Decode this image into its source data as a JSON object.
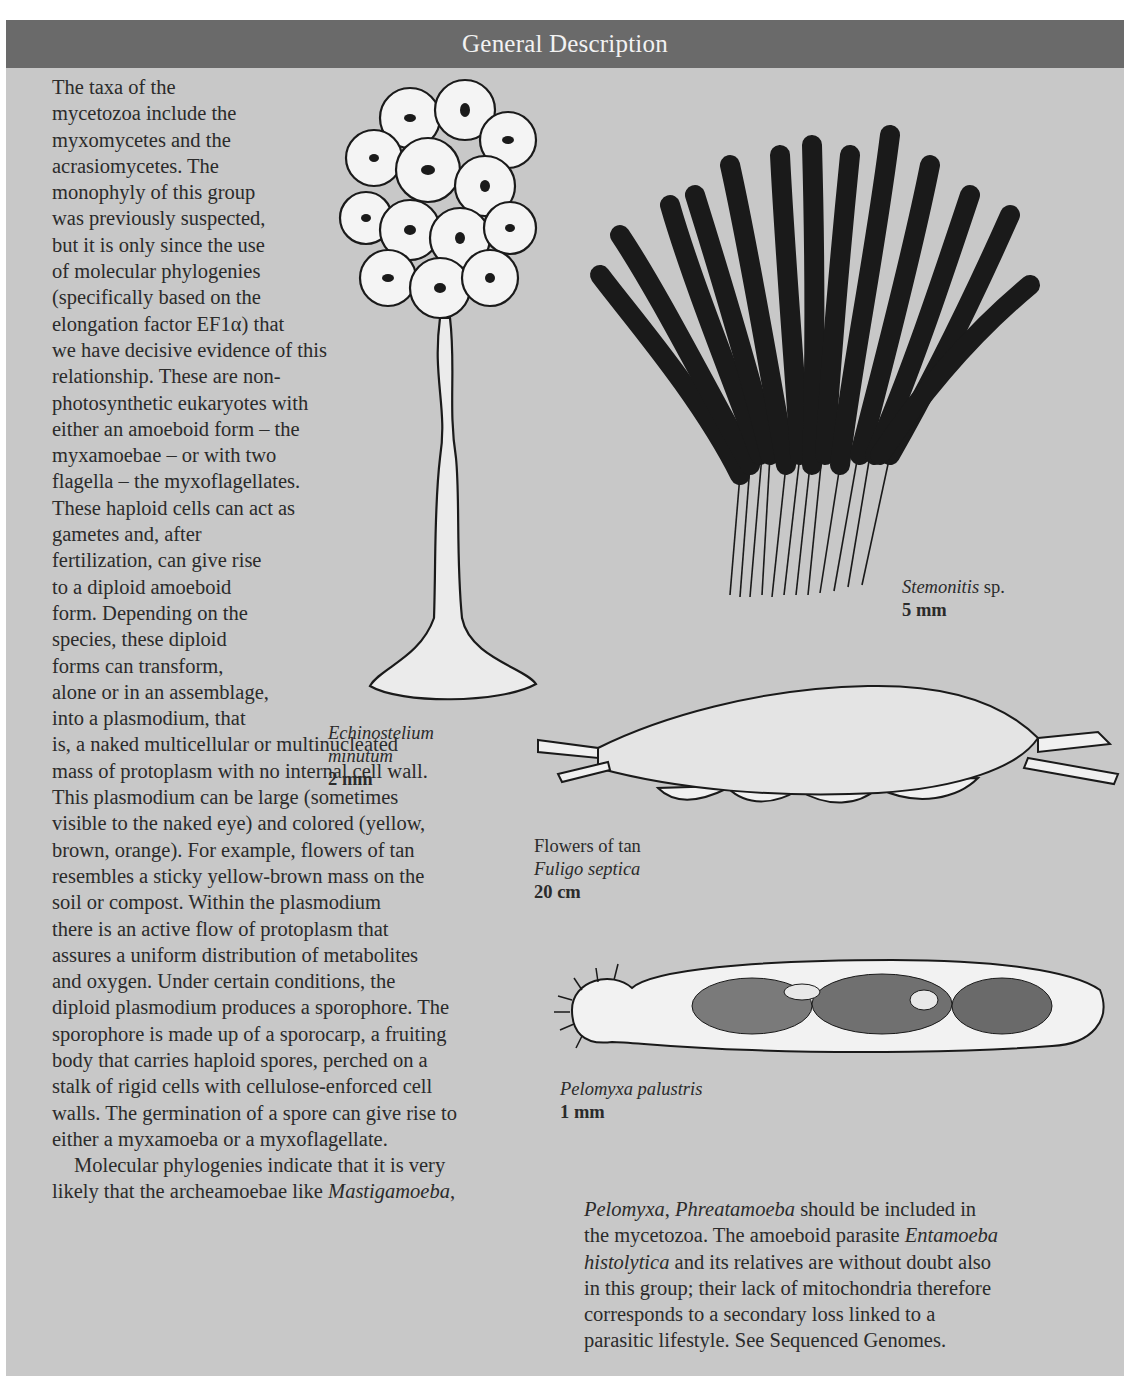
{
  "header": {
    "title": "General Description"
  },
  "colors": {
    "header_bg": "#6a6a6a",
    "panel_bg": "#c8c8c8",
    "text": "#2b2b2b",
    "header_text": "#f2f2f2"
  },
  "body_left": {
    "lines": [
      "The taxa of the",
      "mycetozoa include the",
      "myxomycetes and the",
      "acrasiomycetes. The",
      "monophyly of this group",
      "was previously suspected,",
      "but it is only since the use",
      "of molecular phylogenies",
      "(specifically based on the",
      "elongation factor EF1α) that",
      "we have decisive evidence of this",
      "relationship. These are non-",
      "photosynthetic eukaryotes with",
      "either an amoeboid form – the",
      "myxamoebae – or with two",
      "flagella – the myxoflagellates.",
      "These haploid cells can act as",
      "gametes and, after",
      "fertilization, can give rise",
      "to a diploid amoeboid",
      "form. Depending on the",
      "species, these diploid",
      "forms can transform,",
      "alone or in an assemblage,",
      "into a plasmodium, that",
      "is, a naked multicellular or multinucleated",
      "mass of protoplasm with no internal cell wall.",
      "This plasmodium can be large (sometimes",
      "visible to the naked eye) and colored (yellow,",
      "brown, orange). For example, flowers of tan",
      "resembles a sticky yellow-brown mass on the",
      "soil or compost. Within the plasmodium",
      "there is an active flow of protoplasm that",
      "assures a uniform distribution of metabolites",
      "and oxygen. Under certain conditions, the",
      "diploid plasmodium produces a sporophore. The",
      "sporophore is made up of a sporocarp, a fruiting",
      "body that carries haploid spores, perched on a",
      "stalk of rigid cells with cellulose-enforced cell",
      "walls. The germination of a spore can give rise to",
      "either a myxamoeba or a myxoflagellate."
    ],
    "para2_line1": "Molecular phylogenies indicate that it is very",
    "para2_line2_prefix": "likely that the archeamoebae like ",
    "para2_line2_italic": "Mastigamoeba",
    "para2_line2_suffix": ","
  },
  "body_right": {
    "l1_italic_a": "Pelomyxa",
    "l1_sep": ", ",
    "l1_italic_b": "Phreatamoeba",
    "l1_rest": " should be included in",
    "l2_prefix": "the mycetozoa. The amoeboid parasite ",
    "l2_italic": "Entamoeba",
    "l3_italic": "histolytica",
    "l3_rest": " and its relatives are without doubt also",
    "l4": "in this group; their lack of mitochondria therefore",
    "l5": "corresponds to a secondary loss linked to a",
    "l6": "parasitic lifestyle. See Sequenced Genomes."
  },
  "figures": [
    {
      "id": "echinostelium",
      "name_line1": "Echinostelium",
      "name_line2": "minutum",
      "size": "2 mm"
    },
    {
      "id": "stemonitis",
      "name_italic": "Stemonitis",
      "name_suffix": " sp.",
      "size": "5 mm"
    },
    {
      "id": "fuligo",
      "common_name": "Flowers of tan",
      "name": "Fuligo septica",
      "size": "20 cm"
    },
    {
      "id": "pelomyxa",
      "name": "Pelomyxa palustris",
      "size": "1 mm"
    }
  ]
}
